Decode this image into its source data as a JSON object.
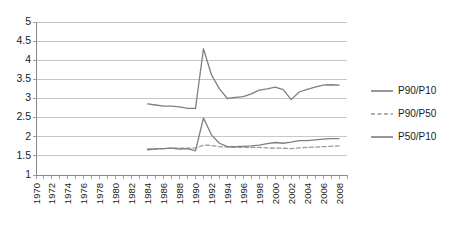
{
  "chart_data": {
    "type": "line",
    "title": "",
    "xlabel": "",
    "ylabel": "",
    "ylim": [
      1,
      5
    ],
    "ytick_step": 0.5,
    "ytick_labels": [
      "5",
      "4.5",
      "4",
      "3.5",
      "3",
      "2.5",
      "2",
      "1.5",
      "1"
    ],
    "xlim": [
      1970,
      2009
    ],
    "xtick_labels": [
      "1970",
      "1972",
      "1974",
      "1976",
      "1978",
      "1980",
      "1982",
      "1984",
      "1986",
      "1988",
      "1990",
      "1992",
      "1994",
      "1996",
      "1998",
      "2000",
      "2002",
      "2004",
      "2006",
      "2008"
    ],
    "grid": true,
    "legend_position": "right",
    "line_color": "#7f7f7f",
    "grid_color": "#b9b9b9",
    "axis_color": "#8a8a8a",
    "x": [
      1984,
      1985,
      1986,
      1987,
      1988,
      1989,
      1990,
      1991,
      1992,
      1993,
      1994,
      1995,
      1996,
      1997,
      1998,
      1999,
      2000,
      2001,
      2002,
      2003,
      2004,
      2005,
      2006,
      2007,
      2008
    ],
    "series": [
      {
        "name": "P90/P10",
        "style": "solid",
        "color": "#7f7f7f",
        "values": [
          2.86,
          2.83,
          2.8,
          2.8,
          2.78,
          2.74,
          2.74,
          4.3,
          3.62,
          3.25,
          3.0,
          3.03,
          3.05,
          3.12,
          3.22,
          3.25,
          3.3,
          3.23,
          2.97,
          3.17,
          3.24,
          3.3,
          3.35,
          3.36,
          3.35
        ]
      },
      {
        "name": "P90/P50",
        "style": "dashed",
        "color": "#9a9a9a",
        "values": [
          1.68,
          1.69,
          1.69,
          1.7,
          1.7,
          1.7,
          1.7,
          1.78,
          1.77,
          1.74,
          1.73,
          1.72,
          1.72,
          1.72,
          1.72,
          1.71,
          1.7,
          1.7,
          1.69,
          1.71,
          1.72,
          1.73,
          1.74,
          1.75,
          1.76
        ]
      },
      {
        "name": "P50/P10",
        "style": "solid",
        "color": "#7f7f7f",
        "values": [
          1.66,
          1.68,
          1.69,
          1.7,
          1.68,
          1.69,
          1.63,
          2.49,
          2.05,
          1.83,
          1.74,
          1.74,
          1.75,
          1.76,
          1.78,
          1.82,
          1.85,
          1.83,
          1.86,
          1.9,
          1.9,
          1.92,
          1.94,
          1.95,
          1.95
        ]
      }
    ]
  },
  "legend": {
    "entries": [
      {
        "label": "P90/P10"
      },
      {
        "label": "P90/P50"
      },
      {
        "label": "P50/P10"
      }
    ]
  }
}
